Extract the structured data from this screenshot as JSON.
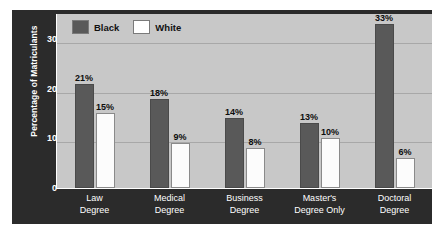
{
  "chart_data": {
    "type": "bar",
    "title": "",
    "xlabel": "",
    "ylabel": "Percentage of Matriculants",
    "ylim": [
      0,
      35
    ],
    "yticks": [
      0,
      10,
      20,
      30
    ],
    "grid": true,
    "legend_position": "top-left",
    "categories": [
      "Law Degree",
      "Medical Degree",
      "Business Degree",
      "Master's Degree Only",
      "Doctoral Degree"
    ],
    "category_lines": [
      [
        "Law",
        "Degree"
      ],
      [
        "Medical",
        "Degree"
      ],
      [
        "Business",
        "Degree"
      ],
      [
        "Master's",
        "Degree Only"
      ],
      [
        "Doctoral",
        "Degree"
      ]
    ],
    "series": [
      {
        "name": "Black",
        "color": "#595959",
        "values": [
          21,
          18,
          14,
          13,
          33
        ],
        "labels": [
          "21%",
          "18%",
          "14%",
          "13%",
          "33%"
        ]
      },
      {
        "name": "White",
        "color": "#ffffff",
        "values": [
          15,
          9,
          8,
          10,
          6
        ],
        "labels": [
          "15%",
          "9%",
          "8%",
          "10%",
          "6%"
        ]
      }
    ]
  },
  "legend": {
    "entries": [
      {
        "label": "Black",
        "color": "#595959"
      },
      {
        "label": "White",
        "color": "#ffffff"
      }
    ]
  },
  "axis": {
    "y_title": "Percentage of Matriculants",
    "y_tick_labels": [
      "30",
      "20",
      "10",
      "0"
    ]
  },
  "colors": {
    "frame": "#2b2b2b",
    "plot_background": "#c8c8c8",
    "gridline": "#a8a8a8",
    "bar_black": "#595959",
    "bar_white": "#ffffff",
    "text_light": "#ffffff",
    "text_dark": "#0d0d0d"
  }
}
